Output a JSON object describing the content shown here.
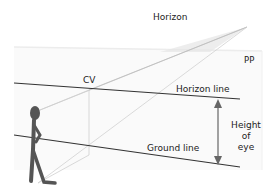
{
  "diagram": {
    "labels": {
      "horizon": "Horizon",
      "pp": "PP",
      "cv": "CV",
      "horizon_line": "Horizon line",
      "ground_line": "Ground line",
      "height_of_eye_1": "Height",
      "height_of_eye_2": "of",
      "height_of_eye_3": "eye"
    },
    "colors": {
      "line_dark": "#333333",
      "line_light": "#c8c8c8",
      "figure": "#555555",
      "arrow": "#666666",
      "plane": "#f3f3f3"
    }
  }
}
